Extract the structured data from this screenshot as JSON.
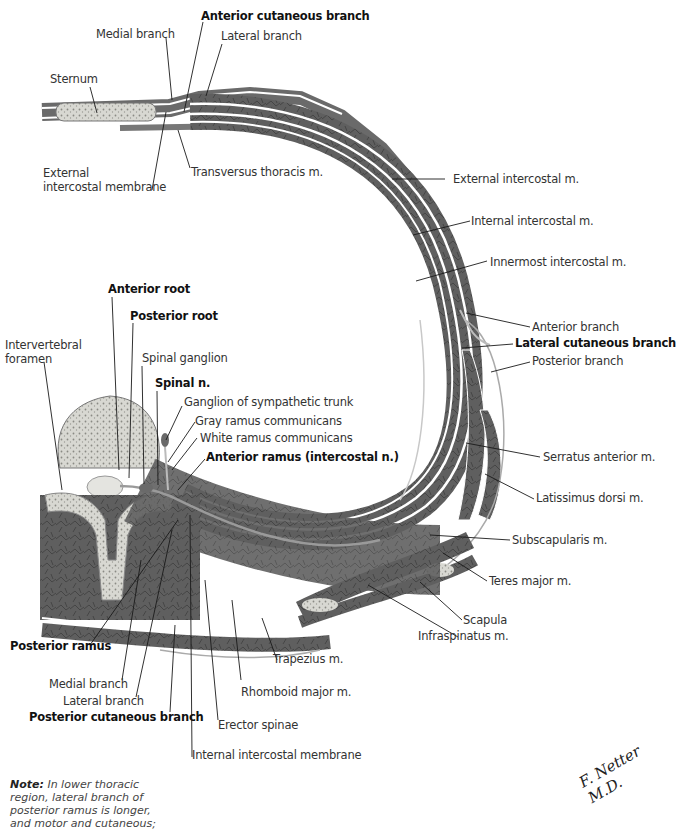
{
  "figure": {
    "type": "anatomical cross-section",
    "labels": {
      "anterior_cutaneous_branch": "Anterior cutaneous branch",
      "medial_branch_top": "Medial branch",
      "lateral_branch_top": "Lateral branch",
      "sternum": "Sternum",
      "external_intercostal_membrane_1": "External",
      "external_intercostal_membrane_2": "intercostal membrane",
      "transversus_thoracis": "Transversus thoracis m.",
      "external_intercostal": "External intercostal m.",
      "internal_intercostal": "Internal intercostal m.",
      "innermost_intercostal": "Innermost intercostal m.",
      "anterior_branch": "Anterior branch",
      "lateral_cutaneous_branch": "Lateral cutaneous branch",
      "posterior_branch": "Posterior branch",
      "anterior_root": "Anterior root",
      "posterior_root": "Posterior root",
      "intervertebral_foramen_1": "Intervertebral",
      "intervertebral_foramen_2": "foramen",
      "spinal_ganglion": "Spinal ganglion",
      "spinal_n": "Spinal n.",
      "ganglion_sympathetic_trunk": "Ganglion of sympathetic trunk",
      "gray_ramus": "Gray ramus communicans",
      "white_ramus": "White ramus communicans",
      "anterior_ramus": "Anterior ramus (intercostal n.)",
      "serratus_anterior": "Serratus anterior m.",
      "latissimus_dorsi": "Latissimus dorsi m.",
      "subscapularis": "Subscapularis m.",
      "teres_major": "Teres major m.",
      "scapula": "Scapula",
      "infraspinatus": "Infraspinatus m.",
      "posterior_ramus": "Posterior ramus",
      "trapezius": "Trapezius m.",
      "medial_branch_bottom": "Medial branch",
      "lateral_branch_bottom": "Lateral branch",
      "rhomboid_major": "Rhomboid major m.",
      "posterior_cutaneous_branch": "Posterior cutaneous branch",
      "erector_spinae": "Erector spinae",
      "internal_intercostal_membrane": "Internal intercostal membrane"
    },
    "note": {
      "prefix": "Note:",
      "text": " In lower thoracic\nregion, lateral branch of\nposterior ramus is longer,\nand motor and cutaneous;"
    },
    "signature": "F. Netter M.D.",
    "colors": {
      "muscle": "#5e5e5e",
      "muscle_dark": "#484848",
      "bone": "#d6d6d0",
      "bone_speckle": "#8a8a84",
      "fascia": "#ffffff",
      "nerve": "#bdbdbd",
      "leader": "#1a1a1a"
    }
  }
}
